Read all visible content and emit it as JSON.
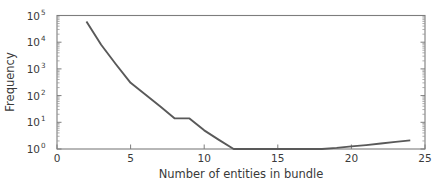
{
  "chart_data": {
    "type": "line",
    "title": "",
    "xlabel": "Number of entities in bundle",
    "ylabel": "Frequency",
    "xlim": [
      0,
      25
    ],
    "ylim": [
      1,
      100000
    ],
    "yscale": "log",
    "xscale": "linear",
    "grid": false,
    "legend": null,
    "xticks": [
      0,
      5,
      10,
      15,
      20,
      25
    ],
    "xtick_labels": [
      "0",
      "5",
      "10",
      "15",
      "20",
      "25"
    ],
    "yticks": [
      1,
      10,
      100,
      1000,
      10000,
      100000
    ],
    "ytick_labels": [
      "10^0",
      "10^1",
      "10^2",
      "10^3",
      "10^4",
      "10^5"
    ],
    "ytick_mantissa": [
      "10",
      "10",
      "10",
      "10",
      "10",
      "10"
    ],
    "ytick_exponents": [
      "0",
      "1",
      "2",
      "3",
      "4",
      "5"
    ],
    "line_color": "#595959",
    "series": [
      {
        "name": "bundle frequency",
        "x": [
          2,
          3,
          4,
          5,
          6,
          7,
          8,
          9,
          10,
          11,
          12,
          13,
          14,
          15,
          16,
          17,
          18,
          19,
          20,
          21,
          22,
          23,
          24
        ],
        "values": [
          60000,
          8000,
          1500,
          300,
          110,
          40,
          14,
          14,
          5,
          2.2,
          1,
          1,
          1,
          1,
          1,
          1,
          1,
          1.1,
          1.25,
          1.4,
          1.6,
          1.85,
          2.1
        ]
      }
    ],
    "annotations": [
      "steep log-linear decay from x=2 to x=8",
      "plateau near frequency 14 between x=8 and x=9",
      "floor at frequency 1 between x=12 and x=18",
      "slight rise from x=18 to x=24"
    ]
  },
  "figure": {
    "background_color": "#ffffff",
    "spine_color": "#7d7d7d",
    "text_color": "#3a3a3a"
  }
}
